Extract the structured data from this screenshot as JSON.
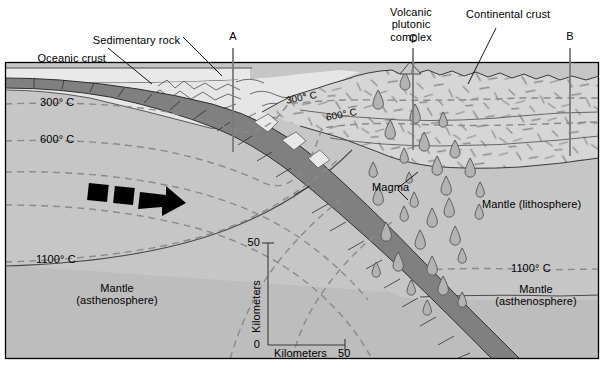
{
  "figure": {
    "frame_color": "#000000",
    "colors": {
      "water": "#e9e9e9",
      "sediment": "#e3e3e3",
      "oceanic_crust": "#808080",
      "continental_crust": "#d5d5d5",
      "mantle_lithosphere": "#c6c6c6",
      "asthenosphere": "#bdbdbd",
      "isotherm": "#8a8a8a",
      "magma": "#b3b3b3",
      "arrow": "#000000",
      "marker_line": "#7a7a7a"
    }
  },
  "labels": {
    "oceanic_crust": "Oceanic crust",
    "sedimentary_rock": "Sedimentary rock",
    "volcanic_plutonic_complex": "Volcanic\nplutonic\ncomplex",
    "continental_crust": "Continental crust",
    "magma": "Magma",
    "mantle_lithosphere": "Mantle (lithosphere)",
    "mantle_asthenosphere_left": "Mantle\n(asthenosphere)",
    "mantle_asthenosphere_right": "Mantle\n(asthenosphere)"
  },
  "markers": [
    {
      "id": "A",
      "label": "A",
      "x": 233
    },
    {
      "id": "C",
      "label": "C",
      "x": 413
    },
    {
      "id": "B",
      "label": "B",
      "x": 570
    }
  ],
  "isotherms": [
    {
      "id": "iso-300-left",
      "label": "300° C",
      "x": 40,
      "y": 103
    },
    {
      "id": "iso-600-left",
      "label": "600° C",
      "x": 40,
      "y": 140
    },
    {
      "id": "iso-1100-left",
      "label": "1100° C",
      "x": 40,
      "y": 260
    },
    {
      "id": "iso-300-mid",
      "label": "300° C",
      "x": 289,
      "y": 103
    },
    {
      "id": "iso-600-mid",
      "label": "600° C",
      "x": 329,
      "y": 118
    },
    {
      "id": "iso-1100-right",
      "label": "1100° C",
      "x": 510,
      "y": 268
    }
  ],
  "scale_bar": {
    "y_axis_label": "Kilometers",
    "y_max": "50",
    "y_min": "0",
    "x_axis_label": "Kilometers",
    "x_max": "50"
  },
  "motion_arrows": [
    {
      "id": "oceanic-plate-arrow",
      "direction": "right",
      "dashes": 2
    },
    {
      "id": "continental-plate-arrow",
      "direction": "left",
      "dashes": 2
    }
  ]
}
